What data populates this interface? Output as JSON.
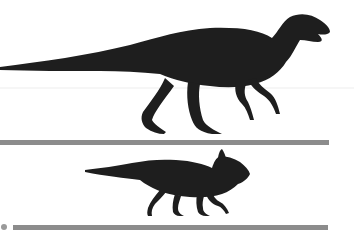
{
  "figure": {
    "colors": {
      "background": "#ffffff",
      "silhouette": "#1e1e1e",
      "scale_bar": "#8c8c8c",
      "faint_line": "#ececec"
    },
    "silhouettes": [
      {
        "name": "large-hadrosaur",
        "label": "Large ornithopod (hadrosaur-like)"
      },
      {
        "name": "small-ceratopsian",
        "label": "Small ceratopsian"
      }
    ],
    "scale_bars": [
      {
        "name": "scale-bar-upper"
      },
      {
        "name": "scale-bar-lower",
        "has_marker": true
      }
    ]
  }
}
